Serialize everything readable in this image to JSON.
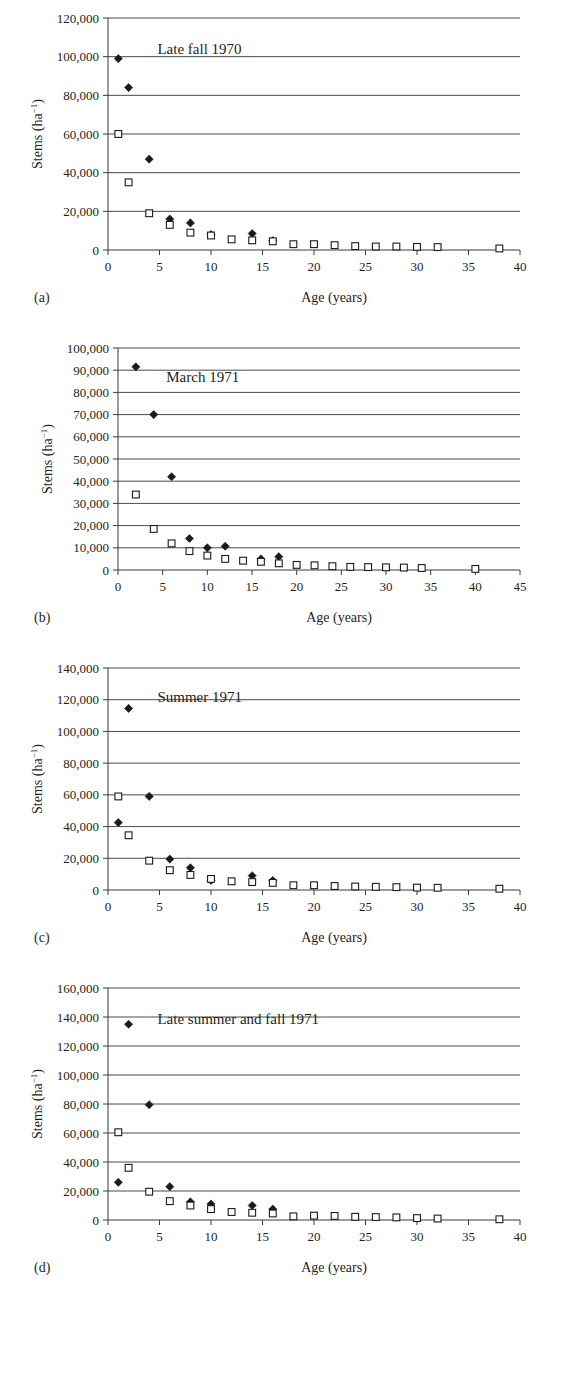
{
  "figure": {
    "panels": [
      {
        "letter": "(a)",
        "title": "Late fall 1970",
        "xlabel": "Age (years)",
        "ylabel_main": "Stems (ha",
        "ylabel_sup": "−1",
        "ylabel_close": ")",
        "xlim": [
          0,
          40
        ],
        "xticks": [
          0,
          5,
          10,
          15,
          20,
          25,
          30,
          35,
          40
        ],
        "ylim": [
          0,
          120000
        ],
        "yticks": [
          0,
          20000,
          40000,
          60000,
          80000,
          100000,
          120000
        ],
        "ytick_labels": [
          "0",
          "20,000",
          "40,000",
          "60,000",
          "80,000",
          "100,000",
          "120,000"
        ]
      },
      {
        "letter": "(b)",
        "title": "March 1971",
        "xlabel": "Age (years)",
        "ylabel_main": "Stems (ha",
        "ylabel_sup": "−1",
        "ylabel_close": ")",
        "xlim": [
          0,
          45
        ],
        "xticks": [
          0,
          5,
          10,
          15,
          20,
          25,
          30,
          35,
          40,
          45
        ],
        "ylim": [
          0,
          100000
        ],
        "yticks": [
          0,
          10000,
          20000,
          30000,
          40000,
          50000,
          60000,
          70000,
          80000,
          90000,
          100000
        ],
        "ytick_labels": [
          "0",
          "10,000",
          "20,000",
          "30,000",
          "40,000",
          "50,000",
          "60,000",
          "70,000",
          "80,000",
          "90,000",
          "100,000"
        ]
      },
      {
        "letter": "(c)",
        "title": "Summer 1971",
        "xlabel": "Age (years)",
        "ylabel_main": "Stems (ha",
        "ylabel_sup": "−1",
        "ylabel_close": ")",
        "xlim": [
          0,
          40
        ],
        "xticks": [
          0,
          5,
          10,
          15,
          20,
          25,
          30,
          35,
          40
        ],
        "ylim": [
          0,
          140000
        ],
        "yticks": [
          0,
          20000,
          40000,
          60000,
          80000,
          100000,
          120000,
          140000
        ],
        "ytick_labels": [
          "0",
          "20,000",
          "40,000",
          "60,000",
          "80,000",
          "100,000",
          "120,000",
          "140,000"
        ]
      },
      {
        "letter": "(d)",
        "title": "Late summer and fall 1971",
        "xlabel": "Age (years)",
        "ylabel_main": "Stems (ha",
        "ylabel_sup": "−1",
        "ylabel_close": ")",
        "xlim": [
          0,
          40
        ],
        "xticks": [
          0,
          5,
          10,
          15,
          20,
          25,
          30,
          35,
          40
        ],
        "ylim": [
          0,
          160000
        ],
        "yticks": [
          0,
          20000,
          40000,
          60000,
          80000,
          100000,
          120000,
          140000,
          160000
        ],
        "ytick_labels": [
          "0",
          "20,000",
          "40,000",
          "60,000",
          "80,000",
          "100,000",
          "120,000",
          "140,000",
          "160,000"
        ]
      }
    ]
  },
  "chart_data": [
    {
      "type": "scatter",
      "panel": "(a)",
      "title": "Late fall 1970",
      "xlabel": "Age (years)",
      "ylabel": "Stems (ha−1)",
      "xlim": [
        0,
        40
      ],
      "ylim": [
        0,
        120000
      ],
      "grid": "horizontal",
      "legend": "none",
      "series": [
        {
          "name": "filled-diamond",
          "marker": "diamond-filled",
          "points": [
            [
              1,
              99000
            ],
            [
              2,
              84000
            ],
            [
              4,
              47000
            ],
            [
              6,
              16000
            ],
            [
              8,
              14000
            ],
            [
              10,
              8000
            ],
            [
              14,
              8500
            ],
            [
              16,
              4800
            ]
          ]
        },
        {
          "name": "open-square",
          "marker": "square-open",
          "points": [
            [
              1,
              60000
            ],
            [
              2,
              35000
            ],
            [
              4,
              19000
            ],
            [
              6,
              13000
            ],
            [
              8,
              9000
            ],
            [
              10,
              7500
            ],
            [
              12,
              5500
            ],
            [
              14,
              5000
            ],
            [
              16,
              4500
            ],
            [
              18,
              3000
            ],
            [
              20,
              3000
            ],
            [
              22,
              2500
            ],
            [
              24,
              2000
            ],
            [
              26,
              1800
            ],
            [
              28,
              1800
            ],
            [
              30,
              1600
            ],
            [
              32,
              1500
            ],
            [
              38,
              800
            ]
          ]
        }
      ]
    },
    {
      "type": "scatter",
      "panel": "(b)",
      "title": "March 1971",
      "xlabel": "Age (years)",
      "ylabel": "Stems (ha−1)",
      "xlim": [
        0,
        45
      ],
      "ylim": [
        0,
        100000
      ],
      "grid": "horizontal",
      "legend": "none",
      "series": [
        {
          "name": "filled-diamond",
          "marker": "diamond-filled",
          "points": [
            [
              2,
              91500
            ],
            [
              4,
              70000
            ],
            [
              6,
              42000
            ],
            [
              8,
              14200
            ],
            [
              10,
              10000
            ],
            [
              12,
              10700
            ],
            [
              16,
              5000
            ],
            [
              18,
              6000
            ]
          ]
        },
        {
          "name": "open-square",
          "marker": "square-open",
          "points": [
            [
              2,
              34000
            ],
            [
              4,
              18500
            ],
            [
              6,
              12000
            ],
            [
              8,
              8500
            ],
            [
              10,
              6500
            ],
            [
              12,
              5000
            ],
            [
              14,
              4200
            ],
            [
              16,
              3700
            ],
            [
              18,
              3000
            ],
            [
              20,
              2300
            ],
            [
              22,
              2100
            ],
            [
              24,
              1700
            ],
            [
              26,
              1400
            ],
            [
              28,
              1300
            ],
            [
              30,
              1200
            ],
            [
              32,
              1100
            ],
            [
              34,
              900
            ],
            [
              40,
              500
            ]
          ]
        }
      ]
    },
    {
      "type": "scatter",
      "panel": "(c)",
      "title": "Summer 1971",
      "xlabel": "Age (years)",
      "ylabel": "Stems (ha−1)",
      "xlim": [
        0,
        40
      ],
      "ylim": [
        0,
        140000
      ],
      "grid": "horizontal",
      "legend": "none",
      "series": [
        {
          "name": "filled-diamond",
          "marker": "diamond-filled",
          "points": [
            [
              1,
              42500
            ],
            [
              2,
              114500
            ],
            [
              4,
              59000
            ],
            [
              6,
              19500
            ],
            [
              8,
              14000
            ],
            [
              10,
              6000
            ],
            [
              14,
              9000
            ],
            [
              16,
              6000
            ]
          ]
        },
        {
          "name": "open-square",
          "marker": "square-open",
          "points": [
            [
              1,
              59000
            ],
            [
              2,
              34500
            ],
            [
              4,
              18500
            ],
            [
              6,
              12500
            ],
            [
              8,
              9500
            ],
            [
              10,
              7000
            ],
            [
              12,
              5500
            ],
            [
              14,
              5000
            ],
            [
              16,
              4500
            ],
            [
              18,
              3000
            ],
            [
              20,
              3000
            ],
            [
              22,
              2500
            ],
            [
              24,
              2200
            ],
            [
              26,
              2000
            ],
            [
              28,
              1800
            ],
            [
              30,
              1500
            ],
            [
              32,
              1400
            ],
            [
              38,
              800
            ]
          ]
        }
      ]
    },
    {
      "type": "scatter",
      "panel": "(d)",
      "title": "Late summer and fall 1971",
      "xlabel": "Age (years)",
      "ylabel": "Stems (ha−1)",
      "xlim": [
        0,
        40
      ],
      "ylim": [
        0,
        160000
      ],
      "grid": "horizontal",
      "legend": "none",
      "series": [
        {
          "name": "filled-diamond",
          "marker": "diamond-filled",
          "points": [
            [
              1,
              26000
            ],
            [
              2,
              135000
            ],
            [
              4,
              79500
            ],
            [
              6,
              23000
            ],
            [
              8,
              12500
            ],
            [
              10,
              11000
            ],
            [
              14,
              10000
            ],
            [
              16,
              7500
            ]
          ]
        },
        {
          "name": "open-square",
          "marker": "square-open",
          "points": [
            [
              1,
              60500
            ],
            [
              2,
              36000
            ],
            [
              4,
              19500
            ],
            [
              6,
              13000
            ],
            [
              8,
              10000
            ],
            [
              10,
              7500
            ],
            [
              12,
              5500
            ],
            [
              14,
              5000
            ],
            [
              16,
              4500
            ],
            [
              18,
              2500
            ],
            [
              20,
              3000
            ],
            [
              22,
              2800
            ],
            [
              24,
              2200
            ],
            [
              26,
              2000
            ],
            [
              28,
              1800
            ],
            [
              30,
              1300
            ],
            [
              32,
              1000
            ],
            [
              38,
              500
            ]
          ]
        }
      ]
    }
  ]
}
